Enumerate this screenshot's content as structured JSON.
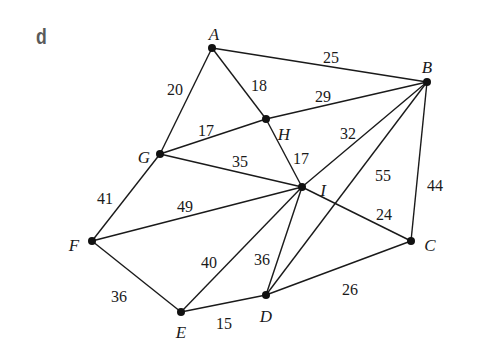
{
  "panel_label": "d",
  "graph": {
    "nodes": [
      {
        "id": "A",
        "x": 212,
        "y": 48,
        "lx": 214,
        "ly": 36
      },
      {
        "id": "B",
        "x": 427,
        "y": 82,
        "lx": 427,
        "ly": 69
      },
      {
        "id": "H",
        "x": 266,
        "y": 119,
        "lx": 284,
        "ly": 136
      },
      {
        "id": "G",
        "x": 160,
        "y": 154,
        "lx": 144,
        "ly": 159
      },
      {
        "id": "I",
        "x": 302,
        "y": 187,
        "lx": 323,
        "ly": 192
      },
      {
        "id": "F",
        "x": 92,
        "y": 241,
        "lx": 74,
        "ly": 247
      },
      {
        "id": "C",
        "x": 411,
        "y": 241,
        "lx": 430,
        "ly": 247
      },
      {
        "id": "E",
        "x": 181,
        "y": 312,
        "lx": 181,
        "ly": 334
      },
      {
        "id": "D",
        "x": 266,
        "y": 295,
        "lx": 266,
        "ly": 318
      }
    ],
    "edges": [
      {
        "from": "A",
        "to": "B",
        "weight": "25",
        "wx": 331,
        "wy": 59
      },
      {
        "from": "A",
        "to": "G",
        "weight": "20",
        "wx": 175,
        "wy": 91
      },
      {
        "from": "A",
        "to": "H",
        "weight": "18",
        "wx": 259,
        "wy": 87
      },
      {
        "from": "H",
        "to": "B",
        "weight": "29",
        "wx": 323,
        "wy": 98
      },
      {
        "from": "G",
        "to": "H",
        "weight": "17",
        "wx": 206,
        "wy": 132
      },
      {
        "from": "G",
        "to": "I",
        "weight": "35",
        "wx": 240,
        "wy": 163
      },
      {
        "from": "H",
        "to": "I",
        "weight": "17",
        "wx": 301,
        "wy": 160
      },
      {
        "from": "I",
        "to": "B",
        "weight": "32",
        "wx": 348,
        "wy": 135
      },
      {
        "from": "D",
        "to": "B",
        "weight": "55",
        "wx": 383,
        "wy": 177
      },
      {
        "from": "C",
        "to": "B",
        "weight": "44",
        "wx": 435,
        "wy": 187
      },
      {
        "from": "I",
        "to": "C",
        "weight": "24",
        "wx": 384,
        "wy": 216
      },
      {
        "from": "G",
        "to": "F",
        "weight": "41",
        "wx": 105,
        "wy": 200
      },
      {
        "from": "F",
        "to": "I",
        "weight": "49",
        "wx": 185,
        "wy": 208
      },
      {
        "from": "E",
        "to": "I",
        "weight": "40",
        "wx": 209,
        "wy": 264
      },
      {
        "from": "D",
        "to": "I",
        "weight": "36",
        "wx": 262,
        "wy": 261
      },
      {
        "from": "F",
        "to": "E",
        "weight": "36",
        "wx": 119,
        "wy": 298
      },
      {
        "from": "E",
        "to": "D",
        "weight": "15",
        "wx": 224,
        "wy": 325
      },
      {
        "from": "D",
        "to": "C",
        "weight": "26",
        "wx": 350,
        "wy": 291
      }
    ]
  }
}
